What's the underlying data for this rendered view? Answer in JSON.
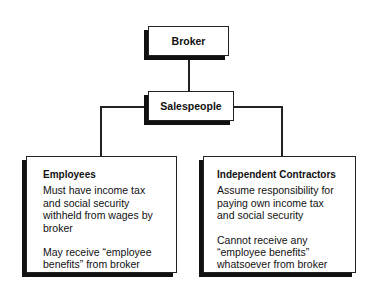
{
  "diagram": {
    "type": "org-chart",
    "nodes": {
      "broker": {
        "label": "Broker"
      },
      "salespeople": {
        "label": "Salespeople"
      },
      "employees": {
        "title": "Employees",
        "paragraphs": [
          "Must have income tax and social security withheld from wages by broker",
          "May receive “employee benefits” from broker"
        ]
      },
      "contractors": {
        "title": "Independent Contractors",
        "paragraphs": [
          "Assume responsibility for paying own income tax and social security",
          "Cannot receive any “employee benefits” whatsoever from broker"
        ]
      }
    },
    "edges": [
      [
        "broker",
        "salespeople"
      ],
      [
        "salespeople",
        "employees"
      ],
      [
        "salespeople",
        "contractors"
      ]
    ]
  }
}
